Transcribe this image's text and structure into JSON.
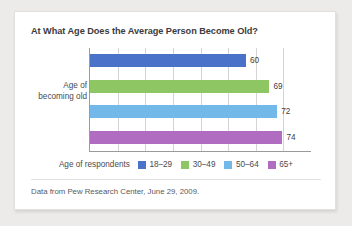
{
  "chart_data": {
    "type": "bar",
    "orientation": "horizontal",
    "title": "At What Age Does the Average Person Become Old?",
    "xlabel": "",
    "ylabel": "Age of becoming old",
    "ylabel_lines": [
      "Age of",
      "becoming old"
    ],
    "categories": [
      "18–29",
      "30–49",
      "50–64",
      "65+"
    ],
    "values": [
      60,
      69,
      72,
      74
    ],
    "value_labels": [
      "60",
      "69",
      "72",
      "74"
    ],
    "xlim": [
      0,
      85
    ],
    "grid": "vertical",
    "gridline_count": 7,
    "legend_position": "bottom",
    "legend_title": "Age of respondents",
    "series": [
      {
        "name": "18–29",
        "value": 60,
        "color": "#4a72c8"
      },
      {
        "name": "30–49",
        "value": 69,
        "color": "#8dc663"
      },
      {
        "name": "50–64",
        "value": 72,
        "color": "#72b8e8"
      },
      {
        "name": "65+",
        "value": 74,
        "color": "#b06cc0"
      }
    ],
    "source_note": "Data from Pew Research Center, June 29, 2009."
  },
  "colors": {
    "page_background": "#ecebe9",
    "card_background": "#ffffff",
    "title_text": "#3b3b3e",
    "body_text": "#4a4a4d",
    "axis_line": "#9b9b9b",
    "gridline": "#d4d4d6"
  }
}
